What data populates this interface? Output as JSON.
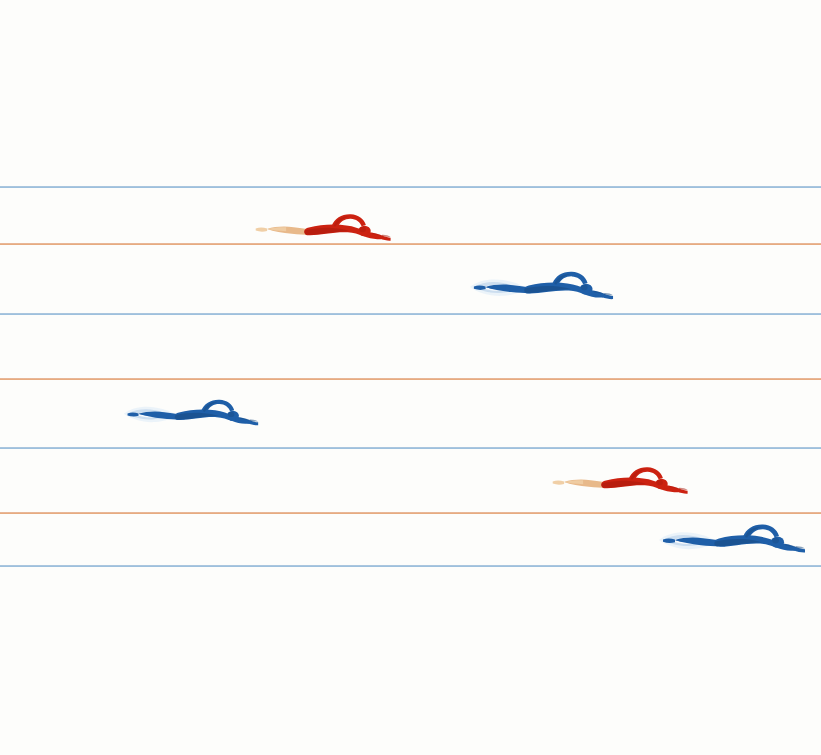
{
  "scene": {
    "title": "Swimmers in a Pool",
    "width": 821,
    "height": 755,
    "background_color": "#fdfdfb",
    "description": "Six stylized swimmers doing front crawl across horizontal ruled lane lines"
  },
  "palette": {
    "background": "#fdfdfb",
    "lane_blue": "#7ea9cf",
    "lane_orange": "#dd8f5e",
    "swimsuit_red": "#cc2211",
    "swimsuit_red_dark": "#a8190c",
    "swimsuit_blue": "#1f5fa8",
    "swimsuit_blue_dark": "#18497f",
    "skin": "#e8b98a",
    "skin_light": "#f0cfa6",
    "splash": "#c9dcee",
    "splash_light": "#eaf2f9"
  },
  "lane_lines": [
    {
      "name": "lane-line-1",
      "color_key": "lane_blue",
      "color": "#7ea9cf",
      "y": 186
    },
    {
      "name": "lane-line-2",
      "color_key": "lane_orange",
      "color": "#dd8f5e",
      "y": 243
    },
    {
      "name": "lane-line-3",
      "color_key": "lane_blue",
      "color": "#7ea9cf",
      "y": 313
    },
    {
      "name": "lane-line-4",
      "color_key": "lane_orange",
      "color": "#dd8f5e",
      "y": 378
    },
    {
      "name": "lane-line-5",
      "color_key": "lane_blue",
      "color": "#7ea9cf",
      "y": 447
    },
    {
      "name": "lane-line-6",
      "color_key": "lane_orange",
      "color": "#dd8f5e",
      "y": 512
    },
    {
      "name": "lane-line-7",
      "color_key": "lane_blue",
      "color": "#7ea9cf",
      "y": 565
    }
  ],
  "swimmers": [
    {
      "id": "swimmer-1",
      "label": "Red swimmer lane 1",
      "color_key": "red",
      "suit_color": "#cc2211",
      "suit_shadow": "#a8190c",
      "skin_color": "#e8b98a",
      "has_splash": false,
      "x": 250,
      "y": 202,
      "scale": 0.95,
      "lane": 1
    },
    {
      "id": "swimmer-2",
      "label": "Blue swimmer lane 2",
      "color_key": "blue",
      "suit_color": "#1f5fa8",
      "suit_shadow": "#18497f",
      "skin_color": "#1f5fa8",
      "has_splash": true,
      "x": 468,
      "y": 260,
      "scale": 0.98,
      "lane": 2
    },
    {
      "id": "swimmer-3",
      "label": "Blue swimmer lane 4",
      "color_key": "blue",
      "suit_color": "#1f5fa8",
      "suit_shadow": "#18497f",
      "skin_color": "#1f5fa8",
      "has_splash": true,
      "x": 122,
      "y": 387,
      "scale": 0.92,
      "lane": 4
    },
    {
      "id": "swimmer-4",
      "label": "Red swimmer lane 5",
      "color_key": "red",
      "suit_color": "#cc2211",
      "suit_shadow": "#a8190c",
      "skin_color": "#e8b98a",
      "has_splash": false,
      "x": 547,
      "y": 455,
      "scale": 0.95,
      "lane": 5
    },
    {
      "id": "swimmer-5",
      "label": "Blue swimmer lane 6",
      "color_key": "blue",
      "suit_color": "#1f5fa8",
      "suit_shadow": "#18497f",
      "skin_color": "#1f5fa8",
      "has_splash": true,
      "x": 657,
      "y": 513,
      "scale": 1.0,
      "lane": 6
    }
  ]
}
